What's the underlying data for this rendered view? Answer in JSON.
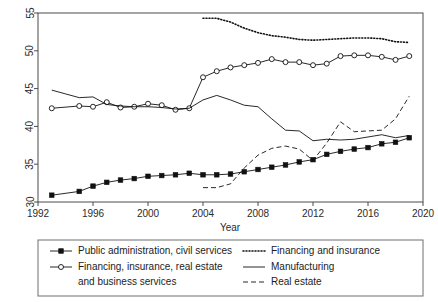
{
  "chart_data": {
    "type": "line",
    "title": "",
    "xlabel": "Year",
    "ylabel": "",
    "xlim": [
      1992,
      2020
    ],
    "ylim": [
      30,
      55
    ],
    "grid": false,
    "legend_position": "bottom",
    "xticks": [
      1992,
      1996,
      2000,
      2004,
      2008,
      2012,
      2016,
      2020
    ],
    "yticks": [
      30,
      35,
      40,
      45,
      50,
      55
    ],
    "series": [
      {
        "name": "Public administration, civil services",
        "marker": "filled-square",
        "linestyle": "solid",
        "x": [
          1993,
          1995,
          1996,
          1997,
          1998,
          1999,
          2000,
          2001,
          2002,
          2003,
          2004,
          2005,
          2006,
          2007,
          2008,
          2009,
          2010,
          2011,
          2012,
          2013,
          2014,
          2015,
          2016,
          2017,
          2018,
          2019
        ],
        "values": [
          30.9,
          31.4,
          32.1,
          32.6,
          32.9,
          33.1,
          33.4,
          33.5,
          33.6,
          33.8,
          33.6,
          33.6,
          33.7,
          34.0,
          34.3,
          34.6,
          34.9,
          35.3,
          35.6,
          36.3,
          36.7,
          37.0,
          37.2,
          37.7,
          37.9,
          38.5
        ]
      },
      {
        "name": "Financing, insurance, real estate and business services",
        "marker": "open-circle",
        "linestyle": "solid",
        "x": [
          1993,
          1995,
          1996,
          1997,
          1998,
          1999,
          2000,
          2001,
          2002,
          2003,
          2004,
          2005,
          2006,
          2007,
          2008,
          2009,
          2010,
          2011,
          2012,
          2013,
          2014,
          2015,
          2016,
          2017,
          2018,
          2019
        ],
        "values": [
          42.4,
          42.7,
          42.6,
          43.2,
          42.5,
          42.6,
          43.0,
          42.8,
          42.2,
          42.4,
          46.5,
          47.3,
          47.8,
          48.1,
          48.4,
          48.9,
          48.5,
          48.5,
          48.1,
          48.3,
          49.3,
          49.4,
          49.4,
          49.2,
          48.8,
          49.3
        ]
      },
      {
        "name": "Financing and insurance",
        "marker": "none",
        "linestyle": "dotted",
        "x": [
          2004,
          2005,
          2006,
          2007,
          2008,
          2009,
          2010,
          2011,
          2012,
          2013,
          2014,
          2015,
          2016,
          2017,
          2018,
          2019
        ],
        "values": [
          54.3,
          54.3,
          53.8,
          53.0,
          52.4,
          52.0,
          51.8,
          51.5,
          51.4,
          51.5,
          51.6,
          51.7,
          51.7,
          51.6,
          51.2,
          51.1
        ]
      },
      {
        "name": "Manufacturing",
        "marker": "none",
        "linestyle": "solid",
        "x": [
          1993,
          1994,
          1995,
          1996,
          1997,
          1998,
          1999,
          2000,
          2001,
          2002,
          2003,
          2004,
          2005,
          2006,
          2007,
          2008,
          2009,
          2010,
          2011,
          2012,
          2013,
          2014,
          2015,
          2016,
          2017,
          2018,
          2019
        ],
        "values": [
          44.8,
          44.3,
          43.8,
          43.9,
          42.9,
          42.7,
          42.6,
          42.6,
          42.5,
          42.3,
          42.4,
          43.5,
          44.1,
          43.5,
          42.8,
          42.6,
          41.0,
          39.5,
          39.4,
          38.1,
          38.3,
          38.2,
          38.3,
          38.6,
          38.9,
          38.5,
          38.8
        ]
      },
      {
        "name": "Real estate",
        "marker": "none",
        "linestyle": "dashed",
        "x": [
          2004,
          2005,
          2006,
          2007,
          2008,
          2009,
          2010,
          2011,
          2012,
          2013,
          2014,
          2015,
          2016,
          2017,
          2018,
          2019
        ],
        "values": [
          31.9,
          31.9,
          32.4,
          34.5,
          36.2,
          37.1,
          37.4,
          37.0,
          35.5,
          37.8,
          40.6,
          39.3,
          39.4,
          39.5,
          41.0,
          44.0
        ]
      }
    ]
  },
  "legend": {
    "entries": [
      {
        "label": "Public administration, civil services",
        "style": "solid-square"
      },
      {
        "label": "Financing, insurance, real estate",
        "style": "solid-circle"
      },
      {
        "label": "and business services",
        "style": "none"
      },
      {
        "label": "Financing and insurance",
        "style": "dotted"
      },
      {
        "label": "Manufacturing",
        "style": "solid"
      },
      {
        "label": "Real estate",
        "style": "dashed"
      }
    ]
  },
  "colors": {
    "line": "#111111",
    "axis": "#4a4a4a",
    "text": "#1c1c1c",
    "background": "#ffffff"
  }
}
